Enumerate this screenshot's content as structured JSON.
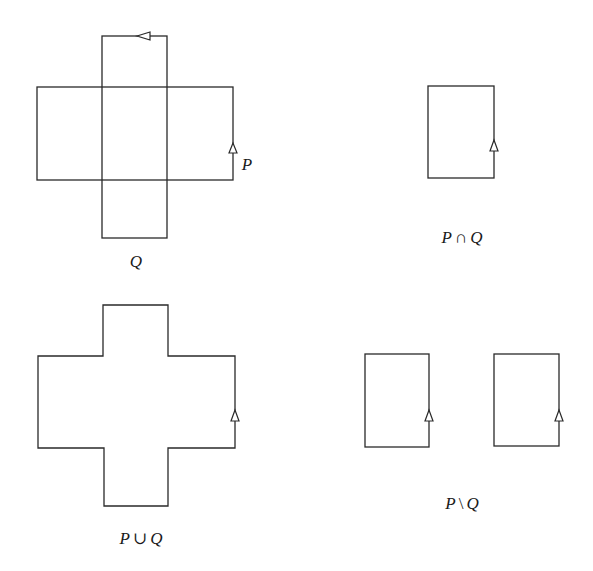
{
  "figure": {
    "stroke_color": "#2a2a2a",
    "background": "#ffffff",
    "panels": [
      {
        "id": "p-and-q",
        "description": "Overlapping polygons P (horizontal rectangle) and Q (vertical rectangle)",
        "labels": {
          "p": "P",
          "q": "Q"
        }
      },
      {
        "id": "intersection",
        "label": {
          "left": "P",
          "op": "∩",
          "right": "Q"
        }
      },
      {
        "id": "union",
        "label": {
          "left": "P",
          "op": "∪",
          "right": "Q"
        }
      },
      {
        "id": "difference",
        "label": {
          "left": "P",
          "op": "\\",
          "right": "Q"
        }
      }
    ]
  }
}
